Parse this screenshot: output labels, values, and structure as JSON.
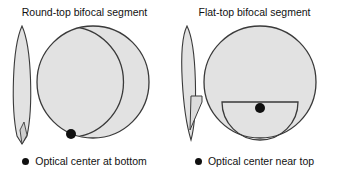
{
  "figure": {
    "background_color": "#ffffff",
    "lens_fill_color": "#e2e2e2",
    "lens_stroke_color": "#3a3a3a",
    "marker_color": "#101010"
  },
  "panels": [
    {
      "id": "round-top",
      "title": "Round-top bifocal segment",
      "caption": "Optical center at bottom",
      "bullet_icon": "filled-circle-icon",
      "profile_label": "lens-edge-profile",
      "front_label": "lens-front-view",
      "segment_shape": "round-top",
      "optical_center_position": "bottom"
    },
    {
      "id": "flat-top",
      "title": "Flat-top bifocal segment",
      "caption": "Optical center near top",
      "bullet_icon": "filled-circle-icon",
      "profile_label": "lens-edge-profile",
      "front_label": "lens-front-view",
      "segment_shape": "flat-top",
      "optical_center_position": "near top"
    }
  ]
}
